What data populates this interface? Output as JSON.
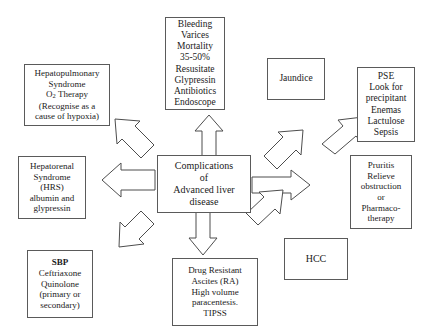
{
  "diagram": {
    "title": "Complications of Advanced liver disease",
    "type": "radial-flow-diagram",
    "background_color": "#ffffff",
    "box_border_color": "#5a5a5a",
    "arrow_fill_color": "#ffffff",
    "arrow_stroke_color": "#4d4d4d",
    "text_color": "#1a1a1a"
  },
  "nodes": {
    "center": {
      "name": "complications-center",
      "lines": [
        "Complications",
        "of",
        "Advanced liver",
        "disease"
      ]
    },
    "bleeding": {
      "name": "bleeding-varices",
      "lines": [
        "Bleeding",
        "Varices",
        "Mortality",
        "35-50%",
        "Resusitate",
        "Glypressin",
        "Antibiotics",
        "Endoscope"
      ]
    },
    "hepatopulmonary": {
      "name": "hepatopulmonary-syndrome",
      "lines": [
        "Hepatopulmonary",
        "Syndrome",
        "O2 Therapy",
        "(Recognise as a",
        "cause of hypoxia)"
      ]
    },
    "jaundice": {
      "name": "jaundice",
      "lines": [
        "Jaundice"
      ]
    },
    "pse": {
      "name": "pse",
      "lines": [
        "PSE",
        "Look for",
        "precipitant",
        "Enemas",
        "Lactulose",
        "Sepsis"
      ]
    },
    "hepatorenal": {
      "name": "hepatorenal-syndrome",
      "lines": [
        "Hepatorenal",
        "Syndrome",
        "(HRS)",
        "albumin and",
        "glypressin"
      ]
    },
    "pruritis": {
      "name": "pruritis",
      "lines": [
        "Pruritis",
        "Relieve",
        "obstruction",
        "or",
        "Pharmaco-",
        "therapy"
      ]
    },
    "sbp": {
      "name": "sbp",
      "lines": [
        "SBP",
        "Ceftriaxone",
        "Quinolone",
        "(primary or",
        "secondary)"
      ]
    },
    "ascites": {
      "name": "drug-resistant-ascites",
      "lines": [
        "Drug Resistant",
        "Ascites (RA)",
        "High volume",
        "paracentesis.",
        "TIPSS"
      ]
    },
    "hcc": {
      "name": "hcc",
      "lines": [
        "HCC"
      ]
    }
  },
  "arrows": [
    {
      "name": "arrow-to-bleeding",
      "direction": "up",
      "from": "center",
      "to": "bleeding"
    },
    {
      "name": "arrow-to-hepatopulmonary",
      "direction": "up-left",
      "from": "center",
      "to": "hepatopulmonary"
    },
    {
      "name": "arrow-to-jaundice",
      "direction": "up-right",
      "from": "center",
      "to": "jaundice"
    },
    {
      "name": "arrow-to-pse",
      "direction": "up-right",
      "from": "center",
      "to": "pse"
    },
    {
      "name": "arrow-to-hepatorenal",
      "direction": "left",
      "from": "center",
      "to": "hepatorenal"
    },
    {
      "name": "arrow-to-pruritis",
      "direction": "right",
      "from": "center",
      "to": "pruritis"
    },
    {
      "name": "arrow-to-sbp",
      "direction": "down-left",
      "from": "center",
      "to": "sbp"
    },
    {
      "name": "arrow-to-ascites",
      "direction": "down",
      "from": "center",
      "to": "ascites"
    },
    {
      "name": "arrow-to-hcc",
      "direction": "down-right",
      "from": "center",
      "to": "hcc"
    }
  ]
}
